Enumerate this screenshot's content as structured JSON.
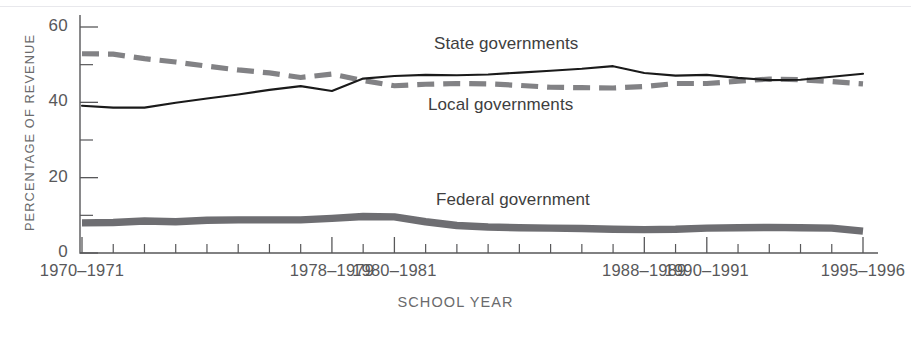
{
  "chart_data": {
    "type": "line",
    "title": "",
    "xlabel": "SCHOOL YEAR",
    "ylabel": "PERCENTAGE OF REVENUE",
    "ylim": [
      0,
      60
    ],
    "yticks": [
      0,
      20,
      40,
      60
    ],
    "yticks_minor": [
      10,
      30,
      50
    ],
    "grid": false,
    "legend": "inline-labels",
    "x": [
      "1970-1971",
      "1971-1972",
      "1972-1973",
      "1973-1974",
      "1974-1975",
      "1975-1976",
      "1976-1977",
      "1977-1978",
      "1978-1979",
      "1979-1980",
      "1980-1981",
      "1981-1982",
      "1982-1983",
      "1983-1984",
      "1984-1985",
      "1985-1986",
      "1986-1987",
      "1987-1988",
      "1988-1989",
      "1989-1990",
      "1990-1991",
      "1991-1992",
      "1992-1993",
      "1993-1994",
      "1994-1995",
      "1995-1996"
    ],
    "xtick_labels": [
      "1970–1971",
      "1978–1979",
      "1980–1981",
      "1988–1989",
      "1990–1991",
      "1995–1996"
    ],
    "xtick_label_indices": [
      0,
      8,
      10,
      18,
      20,
      25
    ],
    "series": [
      {
        "name": "State governments",
        "color": "#1a1a1a",
        "style": "solid",
        "values": [
          39.1,
          38.6,
          38.6,
          39.9,
          41.0,
          42.1,
          43.3,
          44.3,
          43.0,
          46.3,
          47.0,
          47.3,
          47.2,
          47.4,
          47.9,
          48.4,
          48.9,
          49.6,
          47.8,
          47.1,
          47.3,
          46.5,
          45.9,
          46.0,
          46.8,
          47.6
        ]
      },
      {
        "name": "Local governments",
        "color": "#828285",
        "style": "dashed",
        "values": [
          52.9,
          52.8,
          51.6,
          50.7,
          49.6,
          48.6,
          47.8,
          46.6,
          47.5,
          45.8,
          44.4,
          44.8,
          45.0,
          44.9,
          44.5,
          44.0,
          43.9,
          43.8,
          44.2,
          45.0,
          45.0,
          45.6,
          46.2,
          46.0,
          45.5,
          44.9
        ]
      },
      {
        "name": "Federal government",
        "color": "#6e6e72",
        "style": "thick-band",
        "values": [
          8.0,
          8.1,
          8.5,
          8.3,
          8.7,
          8.8,
          8.8,
          8.8,
          9.2,
          9.7,
          9.6,
          8.3,
          7.3,
          6.9,
          6.7,
          6.6,
          6.5,
          6.3,
          6.2,
          6.3,
          6.6,
          6.7,
          6.8,
          6.7,
          6.6,
          5.8
        ]
      }
    ]
  },
  "axis": {
    "y_title": "PERCENTAGE OF REVENUE",
    "x_title": "SCHOOL YEAR",
    "ytick_labels": [
      "0",
      "20",
      "40",
      "60"
    ]
  },
  "labels": {
    "state": "State governments",
    "local": "Local governments",
    "federal": "Federal government"
  }
}
